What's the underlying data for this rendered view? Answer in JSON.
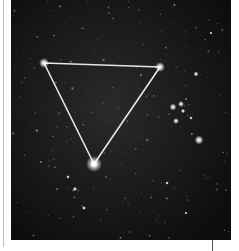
{
  "image": {
    "subject": "Star field with three bright stars connected by a white triangle asterism",
    "background_color": "#141414",
    "line_color": "#e8e8e8",
    "frame": {
      "left_rule_color": "#bdbdbd",
      "tick_color": "#555555"
    },
    "asterism": {
      "shape": "triangle",
      "vertices": [
        {
          "name": "top-left-star",
          "x": 33,
          "y": 63
        },
        {
          "name": "top-right-star",
          "x": 149,
          "y": 67
        },
        {
          "name": "bottom-star",
          "x": 83,
          "y": 164
        }
      ]
    },
    "bright_stars": [
      {
        "x": 188,
        "y": 140,
        "r": 2.2
      },
      {
        "x": 162,
        "y": 107,
        "r": 1.6
      },
      {
        "x": 170,
        "y": 105,
        "r": 1.3
      },
      {
        "x": 165,
        "y": 121,
        "r": 1.4
      },
      {
        "x": 172,
        "y": 110,
        "r": 1.1
      },
      {
        "x": 153,
        "y": 66,
        "r": 1.0
      }
    ]
  }
}
